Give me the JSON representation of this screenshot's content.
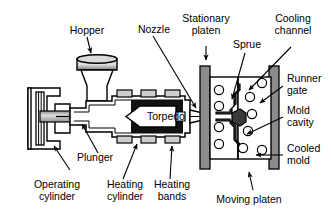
{
  "diagram": {
    "colors": {
      "outline": "#000000",
      "background": "#ffffff",
      "platen_fill": "#8c8c8c",
      "mold_fill": "#ffffff",
      "band_fill": "#cfcfcf",
      "torpedo_chamber_fill": "#111111",
      "sprue_fill": "#3a3a3a",
      "hopper_fill": "#b8b8b8",
      "plunger_fill": "#b0b0b0"
    },
    "labels": {
      "hopper": "Hopper",
      "nozzle": "Nozzle",
      "stationary_platen_line1": "Stationary",
      "stationary_platen_line2": "platen",
      "sprue": "Sprue",
      "cooling_channel_line1": "Cooling",
      "cooling_channel_line2": "channel",
      "runner_gate_line1": "Runner",
      "runner_gate_line2": "gate",
      "mold_cavity_line1": "Mold",
      "mold_cavity_line2": "cavity",
      "cooled_mold_line1": "Cooled",
      "cooled_mold_line2": "mold",
      "torpedo": "Torpedo",
      "plunger": "Plunger",
      "operating_cylinder_line1": "Operating",
      "operating_cylinder_line2": "cylinder",
      "heating_cylinder_line1": "Heating",
      "heating_cylinder_line2": "cylinder",
      "heating_bands_line1": "Heating",
      "heating_bands_line2": "bands",
      "moving_platen": "Moving platen"
    },
    "cooling_channels": {
      "count": 10,
      "radius": 4.6
    }
  }
}
